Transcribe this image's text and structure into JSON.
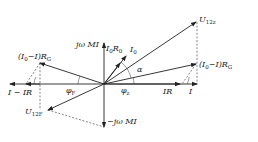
{
  "diagram": {
    "type": "phasor-diagram",
    "colors": {
      "ink": "#222222",
      "background": "#ffffff"
    },
    "labels": {
      "u12z": "U",
      "u12z_sub": "12z",
      "u12f": "U",
      "u12f_sub": "12F",
      "i0": "I",
      "i0_sub": "0",
      "i0r0": "I",
      "i0r0_sub": "0",
      "i0r0_r": "R",
      "i0r0_rsub": "0",
      "jwmi_up": "jω MI",
      "jwmi_down": "−jω MI",
      "right_rg_a": "(I",
      "right_rg_sub": "0",
      "right_rg_b": "−I)R",
      "right_rg_rsub": "G",
      "left_rg_a": "(I",
      "left_rg_sub": "0",
      "left_rg_b": "−I)R",
      "left_rg_rsub": "G",
      "ir": "IR",
      "i": "I",
      "minus_i_ir": "I − IR",
      "alpha": "α",
      "phi_z": "φ",
      "phi_z_sub": "z",
      "phi_f": "φ",
      "phi_f_sub": "F"
    }
  }
}
